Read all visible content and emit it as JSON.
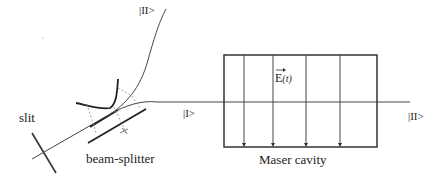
{
  "diagram": {
    "labels": {
      "ket_two_top": "|II>",
      "ket_one": "|I>",
      "ket_two_right": "|II>",
      "slit": "slit",
      "beam_splitter": "beam-splitter",
      "maser_cavity": "Maser cavity",
      "field_symbol": "E",
      "field_arg": "(t)"
    },
    "colors": {
      "line": "#333333",
      "thin_line": "#555555",
      "dashed": "#777777",
      "background": "#ffffff"
    }
  }
}
